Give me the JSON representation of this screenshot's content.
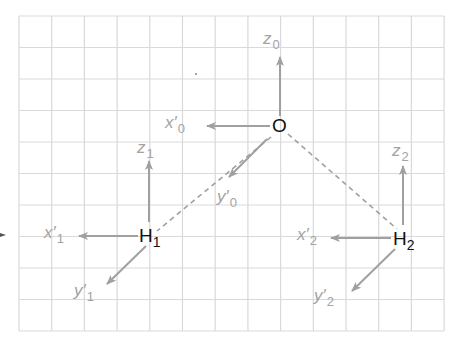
{
  "diagram": {
    "type": "molecule-local-coordinate-frames",
    "grid": {
      "left": 19,
      "top": 16,
      "cols": 13,
      "rows": 10,
      "cell_w": 32.7,
      "cell_h": 31.5,
      "color": "#d9d9d9"
    },
    "colors": {
      "axis_arrow": "#a0a0a0",
      "axis_label": "#a3a3a3",
      "atom_label": "#111111",
      "bond_dash": "#a0a0a0"
    },
    "atoms": [
      {
        "id": "O",
        "symbol": "O",
        "subscript": "",
        "x": 280,
        "y": 126
      },
      {
        "id": "H1",
        "symbol": "H",
        "subscript": "1",
        "x": 149,
        "y": 236
      },
      {
        "id": "H2",
        "symbol": "H",
        "subscript": "2",
        "x": 404,
        "y": 239
      }
    ],
    "bonds": [
      {
        "from": "O",
        "to": "H1",
        "style": "dashed",
        "x1": 271,
        "y1": 137,
        "x2": 157,
        "y2": 231
      },
      {
        "from": "O",
        "to": "H2",
        "style": "dashed",
        "x1": 288,
        "y1": 134,
        "x2": 397,
        "y2": 229
      }
    ],
    "axes": [
      {
        "atom": "O",
        "name": "z",
        "prime": false,
        "subscript": "0",
        "x1": 280,
        "y1": 116,
        "x2": 280,
        "y2": 57,
        "label_x": 263,
        "label_y": 30
      },
      {
        "atom": "O",
        "name": "x",
        "prime": true,
        "subscript": "0",
        "x1": 270,
        "y1": 126,
        "x2": 207,
        "y2": 126,
        "label_x": 165,
        "label_y": 116
      },
      {
        "atom": "O",
        "name": "y",
        "prime": true,
        "subscript": "0",
        "x1": 267,
        "y1": 139,
        "x2": 229,
        "y2": 177,
        "label_x": 218,
        "label_y": 188
      },
      {
        "atom": "H1",
        "name": "z",
        "prime": false,
        "subscript": "1",
        "x1": 149,
        "y1": 222,
        "x2": 149,
        "y2": 161,
        "label_x": 137,
        "label_y": 140
      },
      {
        "atom": "H1",
        "name": "x",
        "prime": true,
        "subscript": "1",
        "x1": 138,
        "y1": 236,
        "x2": 79,
        "y2": 236,
        "label_x": 44,
        "label_y": 225
      },
      {
        "atom": "H1",
        "name": "y",
        "prime": true,
        "subscript": "1",
        "x1": 146,
        "y1": 246,
        "x2": 107,
        "y2": 284,
        "label_x": 74,
        "label_y": 283
      },
      {
        "atom": "H2",
        "name": "z",
        "prime": false,
        "subscript": "2",
        "x1": 403,
        "y1": 225,
        "x2": 403,
        "y2": 166,
        "label_x": 392,
        "label_y": 142
      },
      {
        "atom": "H2",
        "name": "x",
        "prime": true,
        "subscript": "2",
        "x1": 391,
        "y1": 238,
        "x2": 331,
        "y2": 238,
        "label_x": 297,
        "label_y": 227
      },
      {
        "atom": "H2",
        "name": "y",
        "prime": true,
        "subscript": "2",
        "x1": 395,
        "y1": 249,
        "x2": 352,
        "y2": 291,
        "label_x": 315,
        "label_y": 288
      }
    ],
    "labels": {
      "O": {
        "main": "O",
        "sub": ""
      },
      "H1": {
        "main": "H",
        "sub": "1"
      },
      "H2": {
        "main": "H",
        "sub": "2"
      },
      "z0": {
        "main": "z",
        "sub": "0"
      },
      "x0": {
        "main": "x′",
        "sub": "0"
      },
      "y0": {
        "main": "y′",
        "sub": "0"
      },
      "z1": {
        "main": "z",
        "sub": "1"
      },
      "x1": {
        "main": "x′",
        "sub": "1"
      },
      "y1": {
        "main": "y′",
        "sub": "1"
      },
      "z2": {
        "main": "z",
        "sub": "2"
      },
      "x2": {
        "main": "x′",
        "sub": "2"
      },
      "y2": {
        "main": "y′",
        "sub": "2"
      }
    }
  }
}
